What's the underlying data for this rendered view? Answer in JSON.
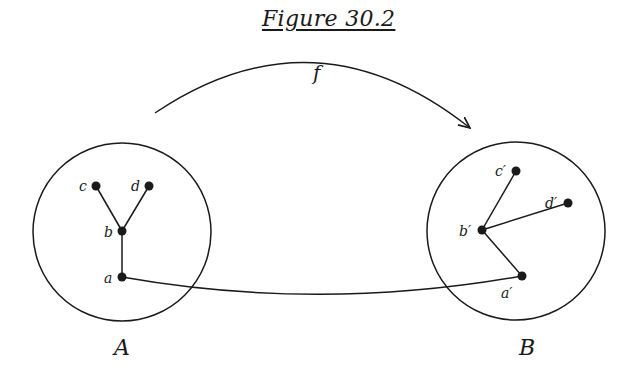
{
  "title": "Figure 30.2",
  "colors": {
    "ink": "#1a1a1a",
    "background": "#ffffff"
  },
  "map_label": "f",
  "sets": [
    {
      "name": "A",
      "nodes": [
        "a",
        "b",
        "c",
        "d"
      ],
      "edges": [
        [
          "c",
          "b"
        ],
        [
          "d",
          "b"
        ],
        [
          "b",
          "a"
        ]
      ]
    },
    {
      "name": "B",
      "nodes": [
        "a′",
        "b′",
        "c′",
        "d′"
      ],
      "edges": [
        [
          "c′",
          "b′"
        ],
        [
          "d′",
          "b′"
        ],
        [
          "b′",
          "a′"
        ]
      ]
    }
  ],
  "labels": {
    "setA": "A",
    "setB": "B",
    "a": "a",
    "b": "b",
    "c": "c",
    "d": "d",
    "a2": "a′",
    "b2": "b′",
    "c2": "c′",
    "d2": "d′"
  },
  "correspondence_edge": [
    "a",
    "a′"
  ]
}
